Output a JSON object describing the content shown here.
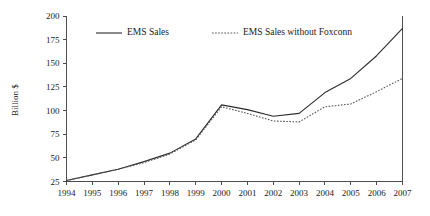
{
  "chart_data": {
    "type": "line",
    "title": "",
    "xlabel": "",
    "ylabel": "Billion $",
    "x": [
      1994,
      1995,
      1996,
      1997,
      1998,
      1999,
      2000,
      2001,
      2002,
      2003,
      2004,
      2005,
      2006,
      2007
    ],
    "categories": [
      "1994",
      "1995",
      "1996",
      "1997",
      "1998",
      "1999",
      "2000",
      "2001",
      "2002",
      "2003",
      "2004",
      "2005",
      "2006",
      "2007"
    ],
    "series": [
      {
        "name": "EMS Sales",
        "style": "solid",
        "color": "#2b2b2b",
        "values": [
          26,
          32,
          38,
          46,
          55,
          70,
          106,
          101,
          94,
          97,
          119,
          134,
          158,
          187
        ]
      },
      {
        "name": "EMS Sales without Foxconn",
        "style": "dotted",
        "color": "#555555",
        "values": [
          26,
          32,
          38,
          45,
          54,
          69,
          104,
          97,
          89,
          88,
          104,
          107,
          120,
          134
        ]
      }
    ],
    "ylim": [
      25,
      200
    ],
    "yticks": [
      25,
      50,
      75,
      100,
      125,
      150,
      175,
      200
    ],
    "ytick_labels": [
      "25",
      "50",
      "75",
      "100",
      "125",
      "150",
      "175",
      "200"
    ],
    "xlim": [
      1994,
      2007
    ],
    "grid": false,
    "legend_position": "top-inside",
    "legend": [
      {
        "label": "EMS Sales",
        "style": "solid"
      },
      {
        "label": "EMS Sales without Foxconn",
        "style": "dotted"
      }
    ]
  }
}
